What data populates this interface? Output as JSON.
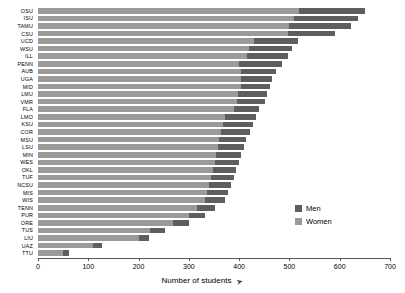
{
  "chart_data": {
    "type": "bar",
    "orientation": "horizontal",
    "stacked": true,
    "title": "",
    "xlabel": "Number of students",
    "ylabel": "",
    "xlim": [
      0,
      700
    ],
    "xticks": [
      0,
      100,
      200,
      300,
      400,
      500,
      600,
      700
    ],
    "grid": false,
    "legend_position": "inside-right",
    "categories": [
      "OSU",
      "ISU",
      "TAMU",
      "CSU",
      "UCD",
      "WSU",
      "ILL",
      "PENN",
      "AUB",
      "UGA",
      "MID",
      "LMU",
      "VMR",
      "FLA",
      "LMO",
      "KSU",
      "COR",
      "MSU",
      "LSU",
      "MIN",
      "WES",
      "OKL",
      "TUF",
      "NCSU",
      "MIS",
      "WIS",
      "TENN",
      "PUR",
      "ORE",
      "TUS",
      "LIU",
      "UAZ",
      "TTU"
    ],
    "series": [
      {
        "name": "Women",
        "color": "#9a9a9a",
        "values": [
          520,
          510,
          500,
          498,
          430,
          420,
          415,
          400,
          404,
          404,
          404,
          398,
          396,
          390,
          372,
          368,
          364,
          360,
          358,
          354,
          352,
          348,
          344,
          340,
          336,
          332,
          316,
          300,
          268,
          222,
          200,
          110,
          50
        ]
      },
      {
        "name": "Men",
        "color": "#5e5e5e",
        "values": [
          130,
          126,
          122,
          92,
          88,
          85,
          82,
          85,
          70,
          62,
          58,
          57,
          56,
          50,
          62,
          60,
          58,
          54,
          52,
          50,
          48,
          46,
          45,
          44,
          42,
          40,
          36,
          33,
          32,
          30,
          20,
          18,
          12
        ]
      }
    ],
    "totals": [
      650,
      636,
      622,
      590,
      518,
      505,
      497,
      485,
      474,
      466,
      462,
      455,
      452,
      440,
      434,
      428,
      422,
      414,
      410,
      404,
      400,
      394,
      389,
      384,
      378,
      372,
      352,
      333,
      300,
      252,
      220,
      128,
      62
    ]
  },
  "legend": {
    "items": [
      {
        "label": "Men",
        "color": "#5e5e5e"
      },
      {
        "label": "Women",
        "color": "#9a9a9a"
      }
    ]
  },
  "axis": {
    "x_title": "Number of students",
    "cursor_glyph": "➤"
  }
}
